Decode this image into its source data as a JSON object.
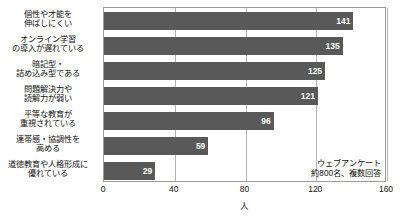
{
  "chart_data": {
    "type": "bar",
    "orientation": "horizontal",
    "title": "",
    "subtitle": "",
    "xlabel": "人",
    "ylabel": "",
    "xlim": [
      0,
      160
    ],
    "xticks": [
      "0",
      "40",
      "80",
      "120",
      "160"
    ],
    "grid": true,
    "legend": null,
    "categories": [
      "個性や才能を\n伸ばしにくい",
      "オンライン学習\nの導入が遅れている",
      "暗記型・\n詰め込み型である",
      "問題解決力や\n読解力が弱い",
      "平等な教育が\n重視されている",
      "連帯感・協調性を\n高める",
      "道徳教育や人格形成に\n優れている"
    ],
    "values": [
      141,
      135,
      125,
      121,
      96,
      59,
      29
    ],
    "annotations": [
      "ウェブアンケート",
      "約800名、複数回答"
    ],
    "colors": {
      "bar": "#595959",
      "value_text": "#ffffff",
      "grid": "#b4b4b4",
      "axis": "#9a9a9a",
      "text": "#111111",
      "background": "#ffffff"
    }
  }
}
